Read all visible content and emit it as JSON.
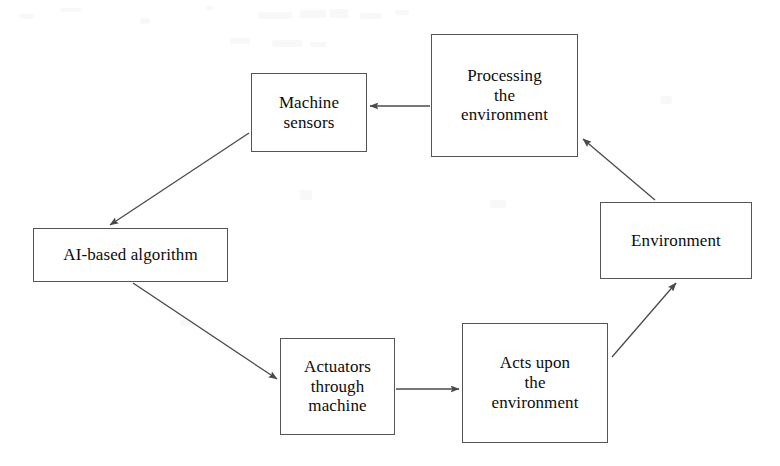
{
  "diagram": {
    "style": {
      "background": "#ffffff",
      "box_border_color": "#555555",
      "box_fill": "#ffffff",
      "text_color": "#0c0c0c",
      "arrow_color": "#4a4a4a"
    },
    "nodes": [
      {
        "id": "machine-sensors",
        "label": "Machine\nsensors",
        "x": 251,
        "y": 73,
        "w": 116,
        "h": 79,
        "font_size": 17
      },
      {
        "id": "processing-the-environment",
        "label": "Processing\nthe\nenvironment",
        "x": 431,
        "y": 34,
        "w": 147,
        "h": 123,
        "font_size": 17
      },
      {
        "id": "environment",
        "label": "Environment",
        "x": 600,
        "y": 202,
        "w": 152,
        "h": 77,
        "font_size": 17
      },
      {
        "id": "ai-based-algorithm",
        "label": "AI-based algorithm",
        "x": 33,
        "y": 228,
        "w": 195,
        "h": 54,
        "font_size": 17
      },
      {
        "id": "actuators-through-machine",
        "label": "Actuators\nthrough\nmachine",
        "x": 280,
        "y": 338,
        "w": 115,
        "h": 97,
        "font_size": 17
      },
      {
        "id": "acts-upon-the-environment",
        "label": "Acts upon\nthe\nenvironment",
        "x": 462,
        "y": 323,
        "w": 146,
        "h": 120,
        "font_size": 17
      }
    ],
    "edges": [
      {
        "id": "processing-to-sensors",
        "from": "processing-the-environment",
        "to": "machine-sensors",
        "x1": 430,
        "y1": 106,
        "x2": 370,
        "y2": 106
      },
      {
        "id": "sensors-to-algorithm",
        "from": "machine-sensors",
        "to": "ai-based-algorithm",
        "x1": 249,
        "y1": 133,
        "x2": 110,
        "y2": 225
      },
      {
        "id": "algorithm-to-actuators",
        "from": "ai-based-algorithm",
        "to": "actuators-through-machine",
        "x1": 133,
        "y1": 283,
        "x2": 277,
        "y2": 379
      },
      {
        "id": "actuators-to-acts",
        "from": "actuators-through-machine",
        "to": "acts-upon-the-environment",
        "x1": 396,
        "y1": 389,
        "x2": 459,
        "y2": 389
      },
      {
        "id": "acts-to-environment",
        "from": "acts-upon-the-environment",
        "to": "environment",
        "x1": 612,
        "y1": 357,
        "x2": 676,
        "y2": 283
      },
      {
        "id": "environment-to-processing",
        "from": "environment",
        "to": "processing-the-environment",
        "x1": 655,
        "y1": 200,
        "x2": 583,
        "y2": 139
      }
    ],
    "noise_marks": [
      {
        "x": 20,
        "y": 14,
        "w": 14,
        "h": 5
      },
      {
        "x": 60,
        "y": 8,
        "w": 22,
        "h": 4
      },
      {
        "x": 140,
        "y": 18,
        "w": 10,
        "h": 6
      },
      {
        "x": 205,
        "y": 6,
        "w": 8,
        "h": 4
      },
      {
        "x": 258,
        "y": 12,
        "w": 34,
        "h": 7
      },
      {
        "x": 300,
        "y": 10,
        "w": 26,
        "h": 8
      },
      {
        "x": 330,
        "y": 9,
        "w": 18,
        "h": 9
      },
      {
        "x": 360,
        "y": 13,
        "w": 22,
        "h": 6
      },
      {
        "x": 395,
        "y": 10,
        "w": 14,
        "h": 5
      },
      {
        "x": 230,
        "y": 38,
        "w": 20,
        "h": 6
      },
      {
        "x": 272,
        "y": 40,
        "w": 30,
        "h": 7
      },
      {
        "x": 310,
        "y": 42,
        "w": 16,
        "h": 5
      },
      {
        "x": 490,
        "y": 200,
        "w": 16,
        "h": 8
      },
      {
        "x": 300,
        "y": 190,
        "w": 12,
        "h": 10
      },
      {
        "x": 180,
        "y": 320,
        "w": 14,
        "h": 6
      },
      {
        "x": 660,
        "y": 96,
        "w": 12,
        "h": 8
      }
    ]
  }
}
